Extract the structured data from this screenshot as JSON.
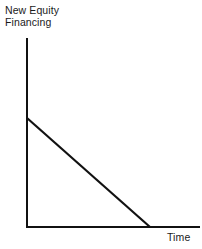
{
  "figure": {
    "background_color": "#ffffff",
    "line_color": "#111111",
    "width": 202,
    "height": 249
  },
  "chart_data": {
    "type": "line",
    "title": "",
    "subtitle": "",
    "xlabel": "Time",
    "ylabel": "New Equity Financing",
    "ylabel_lines": [
      "New Equity",
      "Financing"
    ],
    "grid": false,
    "legend": null,
    "legend_position": "none",
    "axis_ticks": {
      "x": [],
      "y": []
    },
    "xlim": [
      0,
      1
    ],
    "ylim": [
      0,
      1
    ],
    "annotations": [],
    "series": [
      {
        "name": "New Equity Financing",
        "color": "#111111",
        "x": [
          0.0,
          0.715
        ],
        "y": [
          0.577,
          0.0
        ],
        "description": "Linearly declining line from a positive intercept on the vertical axis down to zero partway along the time axis"
      }
    ],
    "axes_geometry": {
      "origin_x": 26,
      "origin_y": 227,
      "y_axis_top": 38,
      "x_axis_right": 200,
      "line_start_x": 27,
      "line_start_y": 118,
      "line_end_x": 150,
      "line_end_y": 227,
      "axis_stroke_width": 2,
      "series_stroke_width": 2.2
    }
  }
}
